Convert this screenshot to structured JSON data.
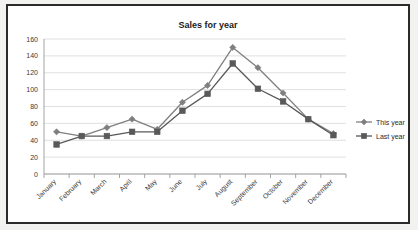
{
  "chart_data": {
    "type": "line",
    "title": "Sales for year",
    "xlabel": "",
    "ylabel": "",
    "ylim": [
      0,
      160
    ],
    "ytick_step": 20,
    "yticks": [
      0,
      20,
      40,
      60,
      80,
      100,
      120,
      140,
      160
    ],
    "grid": true,
    "legend_position": "right",
    "categories": [
      "January",
      "February",
      "March",
      "April",
      "May",
      "June",
      "July",
      "August",
      "September",
      "October",
      "November",
      "December"
    ],
    "series": [
      {
        "name": "This year",
        "marker": "diamond",
        "color": "#7f7f7f",
        "values": [
          50,
          45,
          55,
          65,
          53,
          85,
          105,
          150,
          126,
          96,
          65,
          48
        ]
      },
      {
        "name": "Last year",
        "marker": "square",
        "color": "#595959",
        "values": [
          35,
          45,
          45,
          50,
          50,
          75,
          95,
          131,
          101,
          86,
          65,
          46
        ]
      }
    ]
  },
  "legend": {
    "entries": [
      {
        "label": "This year"
      },
      {
        "label": "Last year"
      }
    ]
  },
  "frame": {
    "border_color": "#2b2b2b",
    "page_background": "#f2f2f0",
    "plot_background": "#ffffff"
  }
}
